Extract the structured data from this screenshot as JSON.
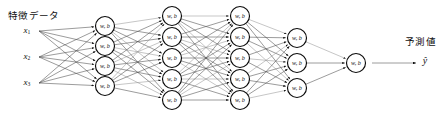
{
  "diagram": {
    "type": "neural-network",
    "title_features": "特徴データ",
    "title_prediction": "予測値",
    "node_label": "w, b",
    "output_symbol": "ŷ",
    "colors": {
      "node_stroke": "#0a0a0a",
      "node_fill": "#ffffff",
      "edge": "#4a4a4a",
      "edge_light": "#8c8c8c",
      "text": "#111111",
      "background": "#ffffff"
    },
    "inputs": [
      {
        "base": "x",
        "sub": "1",
        "full": "x₁"
      },
      {
        "base": "x",
        "sub": "2",
        "full": "x₂"
      },
      {
        "base": "x",
        "sub": "3",
        "full": "x₃"
      }
    ],
    "layers": [
      {
        "name": "hidden-layer-1",
        "node_count": 4,
        "x": 105
      },
      {
        "name": "hidden-layer-2",
        "node_count": 5,
        "x": 172
      },
      {
        "name": "hidden-layer-3",
        "node_count": 5,
        "x": 240
      },
      {
        "name": "hidden-layer-4",
        "node_count": 3,
        "x": 297
      },
      {
        "name": "output-layer",
        "node_count": 1,
        "x": 356
      }
    ],
    "node_radius": 9.5,
    "layer_y_positions": {
      "inputs": [
        31,
        57,
        83
      ],
      "hidden-layer-1": [
        26,
        46,
        66,
        86
      ],
      "hidden-layer-2": [
        16,
        37,
        58,
        79,
        100
      ],
      "hidden-layer-3": [
        16,
        37,
        58,
        79,
        100
      ],
      "hidden-layer-4": [
        38,
        63,
        88
      ],
      "output-layer": [
        63
      ]
    },
    "input_label_x": 27,
    "output_arrow": {
      "x1": 372,
      "x2": 416,
      "y": 63
    },
    "output_symbol_pos": {
      "x": 425,
      "y": 62
    }
  }
}
